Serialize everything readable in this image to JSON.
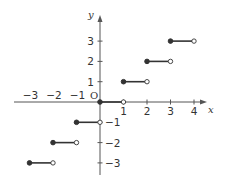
{
  "chart_data": {
    "type": "line",
    "title": "",
    "xlabel": "x",
    "ylabel": "y",
    "origin_label": "O",
    "xlim": [
      -3.5,
      4.5
    ],
    "ylim": [
      -3.5,
      3.8
    ],
    "grid": false,
    "x_ticks": [
      -3,
      -2,
      -1,
      1,
      2,
      3,
      4
    ],
    "x_tick_labels": [
      "−3",
      "−2",
      "−1",
      "1",
      "2",
      "3",
      "4"
    ],
    "y_ticks": [
      -3,
      -2,
      -1,
      1,
      2,
      3
    ],
    "y_tick_labels": [
      "−3",
      "−2",
      "−1",
      "1",
      "2",
      "3"
    ],
    "segments": [
      {
        "x_start": -3,
        "x_end": -2,
        "y": -3,
        "start_closed": true,
        "end_closed": false
      },
      {
        "x_start": -2,
        "x_end": -1,
        "y": -2,
        "start_closed": true,
        "end_closed": false
      },
      {
        "x_start": -1,
        "x_end": 0,
        "y": -1,
        "start_closed": true,
        "end_closed": false
      },
      {
        "x_start": 0,
        "x_end": 1,
        "y": 0,
        "start_closed": true,
        "end_closed": false
      },
      {
        "x_start": 1,
        "x_end": 2,
        "y": 1,
        "start_closed": true,
        "end_closed": false
      },
      {
        "x_start": 2,
        "x_end": 3,
        "y": 2,
        "start_closed": true,
        "end_closed": false
      },
      {
        "x_start": 3,
        "x_end": 4,
        "y": 3,
        "start_closed": true,
        "end_closed": false
      }
    ],
    "colors": {
      "axis": "#555555",
      "line": "#333333",
      "text": "#333333"
    }
  }
}
